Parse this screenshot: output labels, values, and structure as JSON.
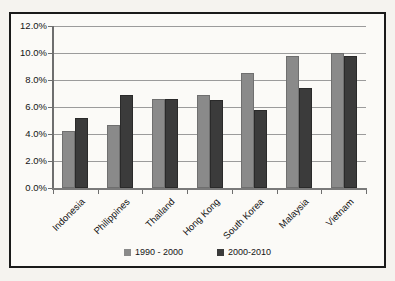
{
  "chart_data": {
    "type": "bar",
    "title": "",
    "categories": [
      "Indonesia",
      "Philippines",
      "Thailand",
      "Hong Kong",
      "South Korea",
      "Malaysia",
      "Vietnam"
    ],
    "series": [
      {
        "name": "1990 - 2000",
        "color": "#8a8a8a",
        "border_color": "#6f6f6f",
        "values": [
          4.2,
          4.7,
          6.6,
          6.9,
          8.5,
          9.8,
          10.0
        ]
      },
      {
        "name": "2000-2010",
        "color": "#3b3b3b",
        "border_color": "#2a2a2a",
        "values": [
          5.2,
          6.9,
          6.6,
          6.5,
          5.8,
          7.4,
          9.8
        ]
      }
    ],
    "y_axis": {
      "min": 0,
      "max": 12,
      "step": 2,
      "tick_labels_top_to_bottom": [
        "12.0%",
        "10.0%",
        "8.0%",
        "6.0%",
        "4.0%",
        "2.0%",
        "0.0%"
      ],
      "unit": "%"
    },
    "x_axis": {
      "label_rotation_deg": -45
    },
    "grid": true,
    "legend_position": "bottom"
  },
  "colors": {
    "page_background": "#f5f3ef",
    "frame_background": "#fbfaf7",
    "frame_border": "#1a1a1a",
    "gridline": "#9b9b9b",
    "axis": "#6e6e6e",
    "text": "#141414",
    "series_1990_2000": "#8a8a8a",
    "series_2000_2010": "#3b3b3b"
  }
}
